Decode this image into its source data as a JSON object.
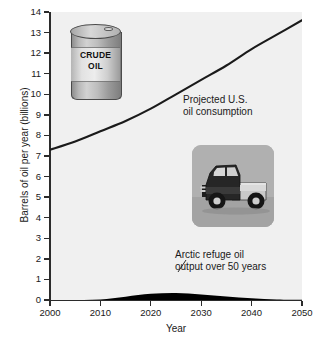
{
  "chart_data": {
    "type": "area",
    "title": "",
    "xlabel": "Year",
    "ylabel": "Barrels of oil per year (billions)",
    "xlim": [
      2000,
      2050
    ],
    "ylim": [
      0,
      14
    ],
    "grid": false,
    "legend_position": "none",
    "x_ticks": [
      "2000",
      "2010",
      "2020",
      "2030",
      "2040",
      "2050"
    ],
    "y_ticks": [
      "0",
      "1",
      "2",
      "3",
      "4",
      "5",
      "6",
      "7",
      "8",
      "9",
      "10",
      "11",
      "12",
      "13",
      "14"
    ],
    "x": [
      2000,
      2005,
      2010,
      2015,
      2020,
      2025,
      2030,
      2035,
      2040,
      2045,
      2050
    ],
    "series": [
      {
        "name": "Projected U.S. oil consumption",
        "type": "line",
        "color": "#1a1a1a",
        "values": [
          7.3,
          7.7,
          8.2,
          8.7,
          9.3,
          10.0,
          10.7,
          11.4,
          12.2,
          12.9,
          13.6
        ]
      },
      {
        "name": "Arctic refuge oil output over 50 years",
        "type": "area",
        "color": "#000000",
        "values": [
          0.0,
          0.0,
          0.02,
          0.16,
          0.3,
          0.34,
          0.27,
          0.17,
          0.09,
          0.03,
          0.01
        ]
      }
    ],
    "annotations": [
      {
        "name": "consumption-label",
        "lines": [
          "Projected U.S.",
          "oil consumption"
        ],
        "x": 2031,
        "y": 10.1
      },
      {
        "name": "arctic-label",
        "lines": [
          "Arctic refuge oil",
          "output over 50 years"
        ],
        "x": 2029,
        "y": 1.9
      }
    ],
    "images": [
      {
        "name": "crude-oil-drum",
        "label_lines": [
          "CRUDE",
          "OIL"
        ]
      },
      {
        "name": "pickup-truck-photo",
        "label_lines": []
      }
    ]
  }
}
